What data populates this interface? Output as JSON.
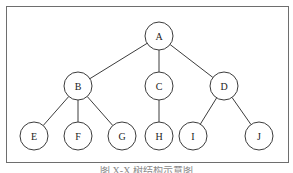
{
  "diagram": {
    "type": "tree",
    "root": "A",
    "nodes": [
      {
        "id": "A",
        "label": "A",
        "x": 159,
        "y": 36
      },
      {
        "id": "B",
        "label": "B",
        "x": 78,
        "y": 86
      },
      {
        "id": "C",
        "label": "C",
        "x": 159,
        "y": 86
      },
      {
        "id": "D",
        "label": "D",
        "x": 224,
        "y": 86
      },
      {
        "id": "E",
        "label": "E",
        "x": 34,
        "y": 136
      },
      {
        "id": "F",
        "label": "F",
        "x": 78,
        "y": 136
      },
      {
        "id": "G",
        "label": "G",
        "x": 122,
        "y": 136
      },
      {
        "id": "H",
        "label": "H",
        "x": 159,
        "y": 136
      },
      {
        "id": "I",
        "label": "I",
        "x": 193,
        "y": 136
      },
      {
        "id": "J",
        "label": "J",
        "x": 259,
        "y": 136
      }
    ],
    "edges": [
      {
        "from": "A",
        "to": "B"
      },
      {
        "from": "A",
        "to": "C"
      },
      {
        "from": "A",
        "to": "D"
      },
      {
        "from": "B",
        "to": "E"
      },
      {
        "from": "B",
        "to": "F"
      },
      {
        "from": "B",
        "to": "G"
      },
      {
        "from": "C",
        "to": "H"
      },
      {
        "from": "D",
        "to": "I"
      },
      {
        "from": "D",
        "to": "J"
      }
    ],
    "node_radius": 14,
    "colors": {
      "stroke": "#3c3c3c",
      "frame": "#6e6e6e",
      "text": "#222222"
    }
  },
  "caption": {
    "text": "图 X-X 树结构示意图"
  }
}
